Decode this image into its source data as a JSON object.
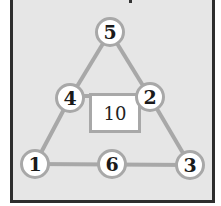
{
  "diagram": {
    "type": "number-triangle-puzzle",
    "center_value": "10",
    "nodes": [
      {
        "id": "top",
        "label": "5",
        "x": 110,
        "y": 32
      },
      {
        "id": "mid-left",
        "label": "4",
        "x": 70,
        "y": 98
      },
      {
        "id": "mid-right",
        "label": "2",
        "x": 150,
        "y": 97
      },
      {
        "id": "bottom-left",
        "label": "1",
        "x": 35,
        "y": 164
      },
      {
        "id": "bottom-middle",
        "label": "6",
        "x": 112,
        "y": 164
      },
      {
        "id": "bottom-right",
        "label": "3",
        "x": 190,
        "y": 165
      }
    ],
    "edges": [
      [
        "top",
        "mid-left"
      ],
      [
        "mid-left",
        "bottom-left"
      ],
      [
        "top",
        "mid-right"
      ],
      [
        "mid-right",
        "bottom-right"
      ],
      [
        "bottom-left",
        "bottom-middle"
      ],
      [
        "bottom-middle",
        "bottom-right"
      ],
      [
        "mid-left",
        "mid-right"
      ]
    ],
    "colors": {
      "background": "#e6e6e6",
      "frame": "#2e2e2e",
      "edge": "#a8a8a8",
      "node_fill": "#ffffff",
      "text": "#1a1a1a"
    }
  }
}
